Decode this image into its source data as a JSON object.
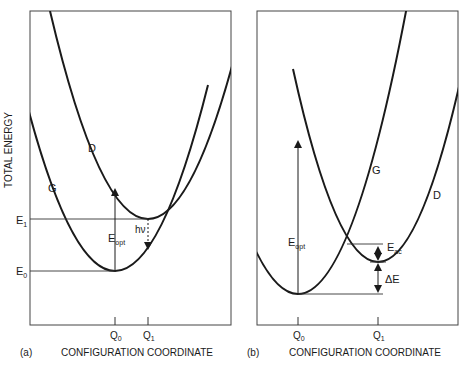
{
  "y_axis_label": "TOTAL ENERGY",
  "panels": [
    {
      "id": "a",
      "tag": "(a)",
      "x_axis_label": "CONFIGURATION COORDINATE",
      "curve_labels": {
        "ground": "G",
        "defect": "D"
      },
      "energy_levels": {
        "e0": "E",
        "e0_sub": "0",
        "e1": "E",
        "e1_sub": "1"
      },
      "ticks": {
        "q0": "Q",
        "q0_sub": "0",
        "q1": "Q",
        "q1_sub": "1"
      },
      "annotations": {
        "eopt": "E",
        "eopt_sub": "opt",
        "emission": "hν"
      }
    },
    {
      "id": "b",
      "tag": "(b)",
      "x_axis_label": "CONFIGURATION COORDINATE",
      "curve_labels": {
        "ground": "G",
        "defect": "D"
      },
      "ticks": {
        "q0": "Q",
        "q0_sub": "0",
        "q1": "Q",
        "q1_sub": "1"
      },
      "annotations": {
        "eopt": "E",
        "eopt_sub": "opt",
        "eac": "E",
        "eac_sub": "ac",
        "delta_e": "ΔE"
      }
    }
  ],
  "colors": {
    "line": "#1a1a1a",
    "frame": "#333333",
    "background": "#ffffff"
  }
}
